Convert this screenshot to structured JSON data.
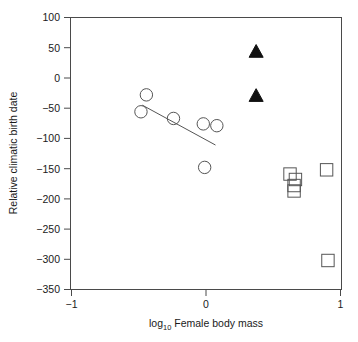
{
  "chart_data": {
    "type": "scatter",
    "title": "",
    "xlabel": "log10 Female body mass",
    "xlabel_base": "log",
    "xlabel_sub": "10",
    "xlabel_rest": " Female body mass",
    "ylabel": "Relative climatic birth date",
    "xlim": [
      -1,
      1
    ],
    "ylim": [
      -350,
      100
    ],
    "xticks": [
      -1,
      0,
      1
    ],
    "xticklabels": [
      "−1",
      "0",
      "1"
    ],
    "yticks": [
      100,
      50,
      0,
      -50,
      -100,
      -150,
      -200,
      -250,
      -300,
      -350
    ],
    "yticklabels": [
      "100",
      "50",
      "0",
      "−50",
      "−100",
      "−150",
      "−200",
      "−250",
      "−300",
      "−350"
    ],
    "grid": false,
    "legend": false,
    "series": [
      {
        "name": "open-circles",
        "marker": "circle-open",
        "points": [
          {
            "x": -0.44,
            "y": -28
          },
          {
            "x": -0.48,
            "y": -56
          },
          {
            "x": -0.24,
            "y": -67
          },
          {
            "x": -0.02,
            "y": -76
          },
          {
            "x": 0.08,
            "y": -79
          },
          {
            "x": -0.01,
            "y": -148
          }
        ]
      },
      {
        "name": "filled-triangles",
        "marker": "triangle-filled",
        "points": [
          {
            "x": 0.37,
            "y": 43
          },
          {
            "x": 0.37,
            "y": -30
          }
        ]
      },
      {
        "name": "open-squares",
        "marker": "square-open",
        "points": [
          {
            "x": 0.62,
            "y": -159
          },
          {
            "x": 0.66,
            "y": -168
          },
          {
            "x": 0.65,
            "y": -178
          },
          {
            "x": 0.65,
            "y": -187
          },
          {
            "x": 0.89,
            "y": -152
          },
          {
            "x": 0.9,
            "y": -302
          }
        ]
      }
    ],
    "trendline": {
      "name": "regression-line",
      "x0": -0.47,
      "y0": -45,
      "x1": 0.07,
      "y1": -111
    }
  }
}
